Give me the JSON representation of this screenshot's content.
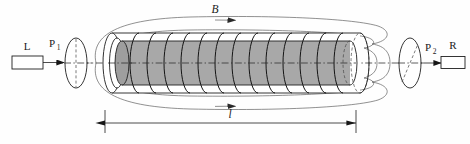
{
  "figure": {
    "kind": "optics-diagram",
    "background_color": "#fefefe"
  },
  "labels": {
    "source": "L",
    "polarizer_base": "P",
    "polarizer_sub": "1",
    "analyzer_base": "P",
    "analyzer_sub": "2",
    "detector": "R",
    "field": "B",
    "length": "l"
  },
  "components": {
    "source_box": {
      "name": "L",
      "style": "open rectangle"
    },
    "polarizer_disc": {
      "name": "P1",
      "style": "ellipse with vertical dashed axis"
    },
    "solenoid": {
      "name": "coil",
      "winding_count": 14,
      "outer_tube_color": "#ffffff",
      "sample_color": "#a8a8a8"
    },
    "analyzer_disc": {
      "name": "P2",
      "style": "ellipse with diagonal dashed axis"
    },
    "detector_box": {
      "name": "R",
      "style": "open rectangle"
    },
    "field_lines": {
      "name": "B",
      "style": "closed loops around solenoid",
      "arrow_count": 2
    },
    "dimension": {
      "name": "l",
      "style": "double arrow with end ticks"
    },
    "optic_axis": {
      "style": "dash-dot centerline"
    }
  },
  "colors": {
    "ink": "#1a1a1a",
    "line": "#3b3b3b",
    "field_line": "#555555",
    "sample_gray": "#a8a8a8",
    "tube_white": "#ffffff"
  }
}
